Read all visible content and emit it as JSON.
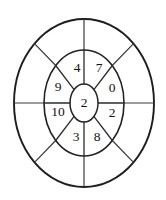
{
  "diagram": {
    "type": "radial-segmented-wheel",
    "background_color": "#ffffff",
    "stroke_color": "#222222",
    "text_color": "#121212",
    "rings": [
      {
        "name": "outer-ring",
        "segment_count": 8,
        "labels": [
          "",
          "",
          "",
          "",
          "",
          "",
          "",
          ""
        ]
      },
      {
        "name": "middle-ring",
        "segment_count": 8,
        "labels": [
          "4",
          "7",
          "0",
          "2",
          "8",
          "3",
          "10",
          "9"
        ]
      },
      {
        "name": "center-hub",
        "segment_count": 1,
        "labels": [
          "2"
        ]
      }
    ],
    "center": {
      "value": "2"
    },
    "middle_segments": [
      {
        "name": "segment-top-left",
        "value": "4",
        "x": 77,
        "y": 69
      },
      {
        "name": "segment-top-right",
        "value": "7",
        "x": 99,
        "y": 69
      },
      {
        "name": "segment-right-upper",
        "value": "0",
        "x": 112,
        "y": 89
      },
      {
        "name": "segment-right-lower",
        "value": "2",
        "x": 112,
        "y": 114
      },
      {
        "name": "segment-bottom-right",
        "value": "8",
        "x": 97,
        "y": 138
      },
      {
        "name": "segment-bottom-left",
        "value": "3",
        "x": 76,
        "y": 138
      },
      {
        "name": "segment-left-lower",
        "value": "10",
        "x": 58,
        "y": 113
      },
      {
        "name": "segment-left-upper",
        "value": "9",
        "x": 58,
        "y": 88
      }
    ],
    "geometry": {
      "center_x": 84,
      "center_y": 103,
      "outer_rx": 70,
      "outer_ry": 84,
      "middle_rx": 40,
      "middle_ry": 53,
      "inner_rx": 14,
      "inner_ry": 19
    }
  }
}
